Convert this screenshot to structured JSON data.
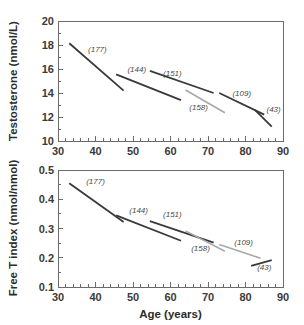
{
  "figure": {
    "background": "#ffffff",
    "axis_color": "#6b6b6b",
    "text_color": "#2b2b2b"
  },
  "chart_data": [
    {
      "id": "testosterone-panel",
      "type": "line",
      "title": "",
      "xlabel": "",
      "ylabel": "Testosterone (nmol/L)",
      "xlim": [
        30,
        90
      ],
      "ylim": [
        10,
        20
      ],
      "xticks": [
        30,
        40,
        50,
        60,
        70,
        80,
        90
      ],
      "xtick_labels": [
        "30",
        "40",
        "50",
        "60",
        "70",
        "80",
        "90"
      ],
      "xminor_step": 2,
      "yticks": [
        10,
        12,
        14,
        16,
        18,
        20
      ],
      "ytick_labels": [
        "10",
        "12",
        "14",
        "16",
        "18",
        "20"
      ],
      "yminor_step": 1,
      "grid": false,
      "legend": "none",
      "series": [
        {
          "name": "(177)",
          "label": "(177)",
          "n": 177,
          "color": "#3a3a3a",
          "width": 1.8,
          "x": [
            33.0,
            47.5
          ],
          "y": [
            18.15,
            14.2
          ],
          "label_x": 40.5,
          "label_y": 17.45
        },
        {
          "name": "(144)",
          "label": "(144)",
          "n": 144,
          "color": "#3a3a3a",
          "width": 1.8,
          "x": [
            45.5,
            62.8
          ],
          "y": [
            15.55,
            13.4
          ],
          "label_x": 51.0,
          "label_y": 15.75
        },
        {
          "name": "(151)",
          "label": "(151)",
          "n": 151,
          "color": "#3a3a3a",
          "width": 1.8,
          "x": [
            54.5,
            71.5
          ],
          "y": [
            15.85,
            14.0
          ],
          "label_x": 60.5,
          "label_y": 15.45
        },
        {
          "name": "(158)",
          "label": "(158)",
          "n": 158,
          "color": "#a8a8a8",
          "width": 1.6,
          "x": [
            64.0,
            74.5
          ],
          "y": [
            14.25,
            12.35
          ],
          "label_x": 67.5,
          "label_y": 12.6
        },
        {
          "name": "(109)",
          "label": "(109)",
          "n": 109,
          "color": "#3a3a3a",
          "width": 1.8,
          "x": [
            73.0,
            85.0
          ],
          "y": [
            14.0,
            12.2
          ],
          "label_x": 79.0,
          "label_y": 13.75
        },
        {
          "name": "(43)",
          "label": "(43)",
          "n": 43,
          "color": "#3a3a3a",
          "width": 1.8,
          "x": [
            82.5,
            87.0
          ],
          "y": [
            12.6,
            11.2
          ],
          "label_x": 87.5,
          "label_y": 12.4
        }
      ]
    },
    {
      "id": "free-t-index-panel",
      "type": "line",
      "title": "",
      "xlabel": "Age (years)",
      "ylabel": "Free T index (nmol/nmol)",
      "xlim": [
        30,
        90
      ],
      "ylim": [
        0.1,
        0.5
      ],
      "xticks": [
        30,
        40,
        50,
        60,
        70,
        80,
        90
      ],
      "xtick_labels": [
        "30",
        "40",
        "50",
        "60",
        "70",
        "80",
        "90"
      ],
      "xminor_step": 2,
      "yticks": [
        0.1,
        0.2,
        0.3,
        0.4,
        0.5
      ],
      "ytick_labels": [
        "0.1",
        "0.2",
        "0.3",
        "0.4",
        "0.5"
      ],
      "yminor_step": 0.05,
      "grid": false,
      "legend": "none",
      "series": [
        {
          "name": "(177)",
          "label": "(177)",
          "n": 177,
          "color": "#3a3a3a",
          "width": 1.8,
          "x": [
            33.0,
            47.5
          ],
          "y": [
            0.455,
            0.322
          ],
          "label_x": 40.0,
          "label_y": 0.452
        },
        {
          "name": "(144)",
          "label": "(144)",
          "n": 144,
          "color": "#3a3a3a",
          "width": 1.8,
          "x": [
            45.5,
            62.8
          ],
          "y": [
            0.345,
            0.258
          ],
          "label_x": 51.5,
          "label_y": 0.352
        },
        {
          "name": "(151)",
          "label": "(151)",
          "n": 151,
          "color": "#3a3a3a",
          "width": 1.8,
          "x": [
            54.5,
            71.5
          ],
          "y": [
            0.325,
            0.252
          ],
          "label_x": 60.5,
          "label_y": 0.338
        },
        {
          "name": "(158)",
          "label": "(158)",
          "n": 158,
          "color": "#a8a8a8",
          "width": 1.6,
          "x": [
            64.0,
            74.5
          ],
          "y": [
            0.292,
            0.222
          ],
          "label_x": 68.0,
          "label_y": 0.222
        },
        {
          "name": "(109)",
          "label": "(109)",
          "n": 109,
          "color": "#a8a8a8",
          "width": 1.6,
          "x": [
            73.0,
            84.0
          ],
          "y": [
            0.245,
            0.198
          ],
          "label_x": 79.5,
          "label_y": 0.245
        },
        {
          "name": "(43)",
          "label": "(43)",
          "n": 43,
          "color": "#3a3a3a",
          "width": 1.8,
          "x": [
            81.5,
            87.0
          ],
          "y": [
            0.172,
            0.192
          ],
          "label_x": 85.0,
          "label_y": 0.158
        }
      ]
    }
  ]
}
